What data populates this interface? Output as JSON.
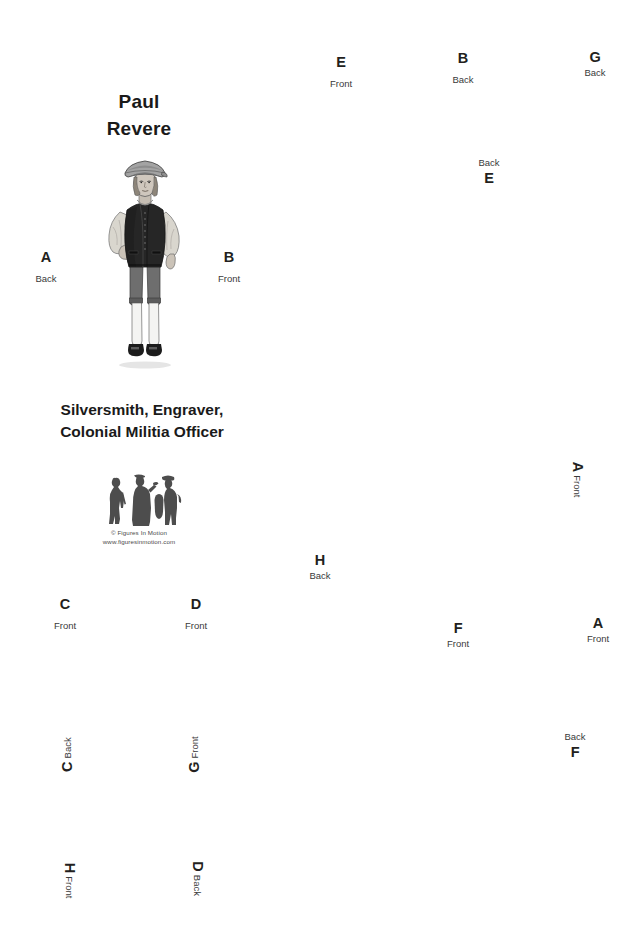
{
  "page": {
    "width": 641,
    "height": 942,
    "background": "#ffffff"
  },
  "header": {
    "title": "Paul\nRevere",
    "subtitle": "Silversmith, Engraver,\nColonial Militia Officer"
  },
  "logo": {
    "copyright": "© Figures In Motion",
    "website": "www.figuresinmotion.com",
    "silhouette_color": "#4d4d4d"
  },
  "figure": {
    "name": "paul-revere-standing-figure",
    "colors": {
      "hat": "#9a9a9a",
      "coat": "#2b2b2b",
      "shirt": "#d8d5cd",
      "breeches": "#6e6e6e",
      "stockings": "#f2f2f2",
      "shoes": "#1f1f1f",
      "skin": "#cfc7bd",
      "outline": "#3a3a3a"
    }
  },
  "markers": [
    {
      "id": "marker-e-front-top",
      "letter": "E",
      "side": "Front",
      "x": 341,
      "y": 72,
      "order": "letter-first",
      "rotation": 0,
      "spacing": "gap"
    },
    {
      "id": "marker-b-back-top",
      "letter": "B",
      "side": "Back",
      "x": 463,
      "y": 68,
      "order": "letter-first",
      "rotation": 0,
      "spacing": "gap"
    },
    {
      "id": "marker-g-back-top",
      "letter": "G",
      "side": "Back",
      "x": 595,
      "y": 64,
      "order": "letter-first",
      "rotation": 0,
      "spacing": "tight"
    },
    {
      "id": "marker-e-back-mid",
      "letter": "E",
      "side": "Back",
      "x": 489,
      "y": 172,
      "order": "side-first",
      "rotation": 0,
      "spacing": "rev"
    },
    {
      "id": "marker-a-back-left",
      "letter": "A",
      "side": "Back",
      "x": 46,
      "y": 267,
      "order": "letter-first",
      "rotation": 0,
      "spacing": "gap"
    },
    {
      "id": "marker-b-front-left",
      "letter": "B",
      "side": "Front",
      "x": 229,
      "y": 267,
      "order": "letter-first",
      "rotation": 0,
      "spacing": "gap"
    },
    {
      "id": "marker-a-front-right",
      "letter": "A",
      "side": "Front",
      "x": 578,
      "y": 479,
      "order": "letter-first",
      "rotation": 90,
      "spacing": "tight"
    },
    {
      "id": "marker-h-back-mid",
      "letter": "H",
      "side": "Back",
      "x": 320,
      "y": 567,
      "order": "letter-first",
      "rotation": 0,
      "spacing": "tight"
    },
    {
      "id": "marker-c-front-low",
      "letter": "C",
      "side": "Front",
      "x": 65,
      "y": 614,
      "order": "letter-first",
      "rotation": 0,
      "spacing": "gap"
    },
    {
      "id": "marker-d-front-low",
      "letter": "D",
      "side": "Front",
      "x": 196,
      "y": 614,
      "order": "letter-first",
      "rotation": 0,
      "spacing": "gap"
    },
    {
      "id": "marker-f-front-low",
      "letter": "F",
      "side": "Front",
      "x": 458,
      "y": 635,
      "order": "letter-first",
      "rotation": 0,
      "spacing": "tight"
    },
    {
      "id": "marker-a-front-low",
      "letter": "A",
      "side": "Front",
      "x": 598,
      "y": 630,
      "order": "letter-first",
      "rotation": 0,
      "spacing": "tight"
    },
    {
      "id": "marker-c-back-rot",
      "letter": "C",
      "side": "Back",
      "x": 67,
      "y": 754,
      "order": "letter-first",
      "rotation": -90,
      "spacing": "tight"
    },
    {
      "id": "marker-g-front-rot",
      "letter": "G",
      "side": "Front",
      "x": 194,
      "y": 754,
      "order": "letter-first",
      "rotation": -90,
      "spacing": "tight"
    },
    {
      "id": "marker-f-back-right",
      "letter": "F",
      "side": "Back",
      "x": 575,
      "y": 746,
      "order": "side-first",
      "rotation": 0,
      "spacing": "rev"
    },
    {
      "id": "marker-h-front-rot",
      "letter": "H",
      "side": "Front",
      "x": 70,
      "y": 880,
      "order": "letter-first",
      "rotation": 90,
      "spacing": "tight"
    },
    {
      "id": "marker-d-back-rot",
      "letter": "D",
      "side": "Back",
      "x": 197,
      "y": 878,
      "order": "letter-first",
      "rotation": 90,
      "spacing": "tight"
    }
  ]
}
